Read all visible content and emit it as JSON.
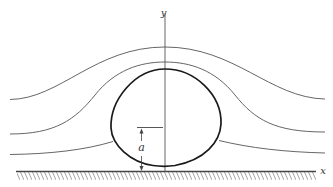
{
  "figure": {
    "axes": {
      "x_label": "x",
      "y_label": "y"
    },
    "dimension": {
      "label": "a",
      "meaning": "height of reference point above wall"
    },
    "streamlines_count": 3,
    "colors": {
      "stroke": "#555555",
      "body_stroke": "#1a1a1a",
      "wall": "#444444",
      "hatch": "#9a9a9a",
      "background": "#ffffff"
    }
  }
}
